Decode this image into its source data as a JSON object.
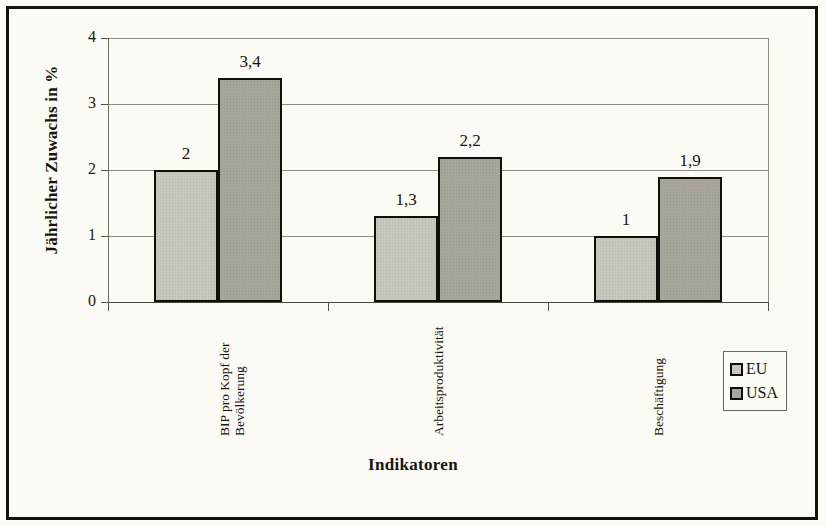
{
  "chart_data": {
    "type": "bar",
    "title": "",
    "xlabel": "Indikatoren",
    "ylabel": "Jährlicher Zuwachs in %",
    "categories": [
      "BIP pro Kopf der Bevölkerung",
      "Arbeitsproduktivität",
      "Beschäftigung"
    ],
    "category_lines": [
      [
        "BIP pro Kopf der",
        "Bevölkerung"
      ],
      [
        "Arbeitsproduktivität"
      ],
      [
        "Beschäftigung"
      ]
    ],
    "series": [
      {
        "name": "EU",
        "color": "#c9c6be",
        "values": [
          2,
          1.3,
          1
        ],
        "labels": [
          "2",
          "1,3",
          "1"
        ]
      },
      {
        "name": "USA",
        "color": "#a8a59c",
        "values": [
          3.4,
          2.2,
          1.9
        ],
        "labels": [
          "3,4",
          "2,2",
          "1,9"
        ]
      }
    ],
    "ylim": [
      0,
      4
    ],
    "yticks": [
      0,
      1,
      2,
      3,
      4
    ],
    "ytick_labels": [
      "0",
      "1",
      "2",
      "3",
      "4"
    ],
    "grid": true,
    "legend_position": "bottom-right",
    "decimal_separator": ","
  },
  "legend": {
    "items": [
      {
        "label": "EU",
        "color": "#c9c6be"
      },
      {
        "label": "USA",
        "color": "#a8a59c"
      }
    ]
  },
  "axes": {
    "y_title": "Jährlicher Zuwachs in %",
    "x_title": "Indikatoren"
  },
  "scan_artifacts": {
    "ghost_1": "",
    "ghost_2": "",
    "ghost_3": ""
  }
}
